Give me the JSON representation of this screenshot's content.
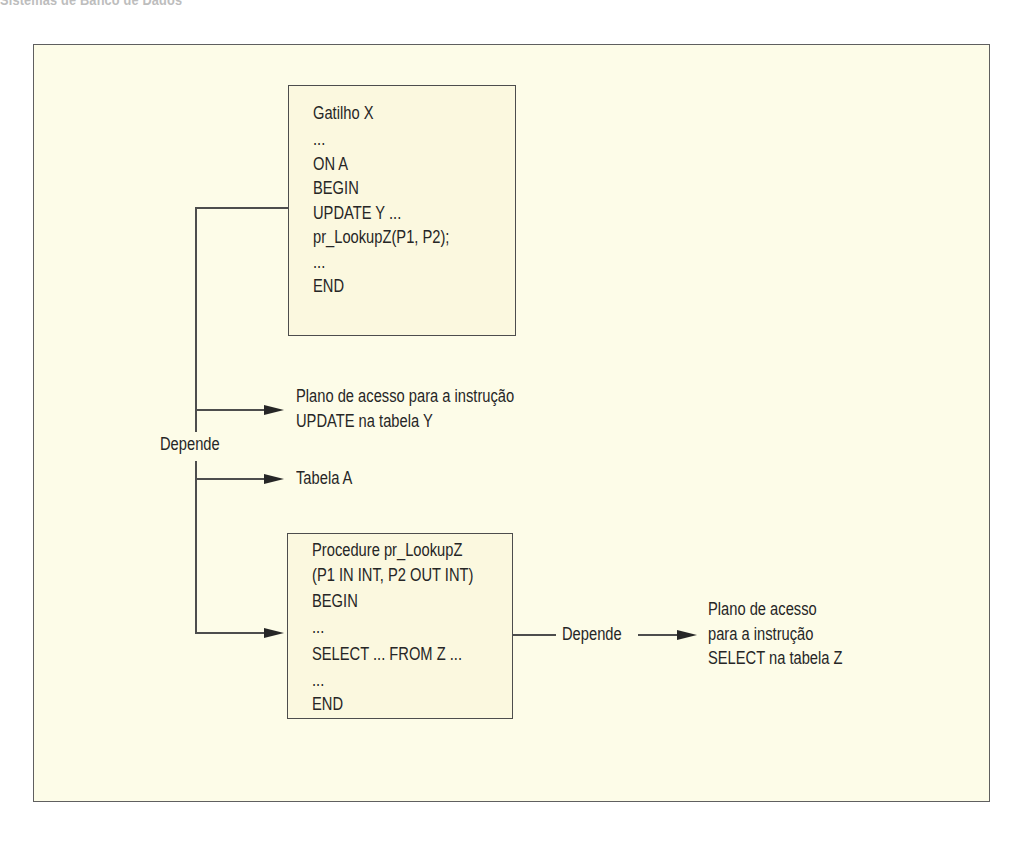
{
  "page": {
    "running_head": "Sistemas de Banco de Dados",
    "colors": {
      "frame_background": "#fdfce8",
      "box_background": "#fbf8df",
      "line": "#4d4d4d",
      "text": "#262626"
    }
  },
  "diagram": {
    "trigger_box": {
      "lines": [
        "Gatilho X",
        "...",
        "ON A",
        "BEGIN",
        "UPDATE Y ...",
        "pr_LookupZ(P1, P2);",
        "...",
        "END"
      ]
    },
    "depends_label_left": "Depende",
    "targets": [
      {
        "lines": [
          "Plano de acesso para a instrução",
          "UPDATE na tabela Y"
        ]
      },
      {
        "lines": [
          "Tabela A"
        ]
      }
    ],
    "procedure_box": {
      "lines": [
        "Procedure pr_LookupZ",
        "(P1 IN INT, P2 OUT INT)",
        "BEGIN",
        "...",
        "SELECT ... FROM Z ...",
        "...",
        "END"
      ]
    },
    "depends_label_right": "Depende",
    "procedure_target": {
      "lines": [
        "Plano de acesso",
        "para a instrução",
        "SELECT na tabela Z"
      ]
    },
    "edges": [
      {
        "from": "Gatilho X",
        "to": "Plano de acesso para a instrução UPDATE na tabela Y",
        "label": "Depende"
      },
      {
        "from": "Gatilho X",
        "to": "Tabela A",
        "label": "Depende"
      },
      {
        "from": "Gatilho X",
        "to": "Procedure pr_LookupZ",
        "label": "Depende"
      },
      {
        "from": "Procedure pr_LookupZ",
        "to": "Plano de acesso para a instrução SELECT na tabela Z",
        "label": "Depende"
      }
    ]
  }
}
